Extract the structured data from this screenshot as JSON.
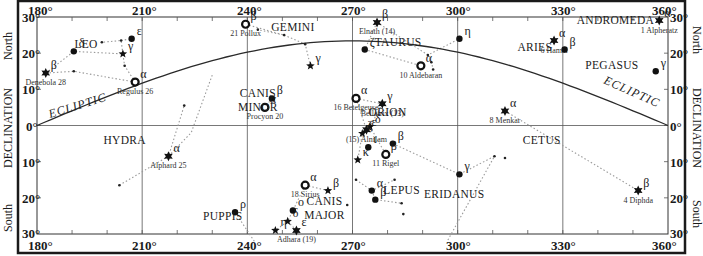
{
  "colors": {
    "frame": "#1a1a1a",
    "grid": "#555555",
    "ecliptic": "#2a2a2a",
    "constellation_line": "#9a9a9a",
    "star": "#111111",
    "text": "#1a1a1a"
  },
  "plot": {
    "left": 37,
    "right": 668,
    "top": 17,
    "bottom": 234,
    "ra_min": 180,
    "ra_max": 360,
    "dec_min": -30,
    "dec_max": 30
  },
  "axes": {
    "x_ticks_top": [
      "180°",
      "210°",
      "240°",
      "270°",
      "300°",
      "330°",
      "360°"
    ],
    "x_ticks_bottom": [
      "180°",
      "210°",
      "240°",
      "270°",
      "300°",
      "330°",
      "360°"
    ],
    "y_ticks": [
      "30°",
      "20°",
      "10°",
      "0°",
      "10°",
      "20°",
      "30°"
    ],
    "left_labels": {
      "north": "North",
      "center": "DECLINATION",
      "south": "South"
    },
    "right_labels": {
      "north": "North",
      "center": "DECLINATION",
      "south": "South"
    }
  },
  "ecliptic": {
    "label_left": "ECLIPTIC",
    "label_right": "ECLIPTIC"
  },
  "chart_data": {
    "type": "scatter",
    "xlabel": "Right Ascension (degrees)",
    "ylabel": "DECLINATION",
    "xlim": [
      180,
      360
    ],
    "ylim": [
      -30,
      30
    ],
    "x_ticks": [
      180,
      210,
      240,
      270,
      300,
      330,
      360
    ],
    "y_ticks": [
      30,
      20,
      10,
      0,
      -10,
      -20,
      -30
    ],
    "grid": true,
    "ecliptic_curve": [
      [
        180,
        0
      ],
      [
        195,
        6
      ],
      [
        210,
        11.5
      ],
      [
        225,
        16.5
      ],
      [
        240,
        20.3
      ],
      [
        255,
        22.6
      ],
      [
        270,
        23.4
      ],
      [
        285,
        22.6
      ],
      [
        300,
        20.3
      ],
      [
        315,
        16.5
      ],
      [
        330,
        11.5
      ],
      [
        345,
        6
      ],
      [
        360,
        0
      ]
    ],
    "constellations": [
      {
        "name": "LEO",
        "label_pos": [
          194,
          21.5
        ]
      },
      {
        "name": "GEMINI",
        "label_pos": [
          253,
          26
        ]
      },
      {
        "name": "TAURUS",
        "label_pos": [
          283,
          22
        ]
      },
      {
        "name": "ARIES",
        "label_pos": [
          322,
          20.5
        ]
      },
      {
        "name": "ANDROMEDA",
        "label_pos": [
          345,
          28
        ]
      },
      {
        "name": "PEGASUS",
        "label_pos": [
          344,
          15.5
        ]
      },
      {
        "name": "CANIS MINOR",
        "label_pos": [
          243,
          8
        ]
      },
      {
        "name": "ORION",
        "label_pos": [
          280,
          2.5
        ]
      },
      {
        "name": "HYDRA",
        "label_pos": [
          205,
          -5
        ]
      },
      {
        "name": "CETUS",
        "label_pos": [
          324,
          -5
        ]
      },
      {
        "name": "LEPUS",
        "label_pos": [
          284,
          -19
        ]
      },
      {
        "name": "ERIDANUS",
        "label_pos": [
          299,
          -20
        ]
      },
      {
        "name": "CANIS MAJOR",
        "label_pos": [
          262,
          -22
        ]
      },
      {
        "name": "PUPPIS",
        "label_pos": [
          233,
          -26
        ]
      }
    ],
    "stars": [
      {
        "id": "denebola",
        "greek": "β",
        "name": "Denebola 28",
        "ra": 182.5,
        "dec": 14.5,
        "sym": "star6"
      },
      {
        "id": "leo-delta",
        "greek": "δ",
        "ra": 190.5,
        "dec": 20.5,
        "sym": "dot"
      },
      {
        "id": "leo-gamma",
        "greek": "γ",
        "ra": 204.5,
        "dec": 19.8,
        "sym": "star5"
      },
      {
        "id": "leo-eps",
        "greek": "ε",
        "ra": 207,
        "dec": 24,
        "sym": "dot"
      },
      {
        "id": "regulus",
        "greek": "α",
        "name": "Regulus 26",
        "ra": 208,
        "dec": 12,
        "sym": "ring"
      },
      {
        "id": "pollux",
        "greek": "β",
        "name": "21 Pollux",
        "ra": 239.5,
        "dec": 28,
        "sym": "ring"
      },
      {
        "id": "gem-gamma",
        "greek": "γ",
        "ra": 258,
        "dec": 16.5,
        "sym": "star5"
      },
      {
        "id": "elnath",
        "greek": "β",
        "name": "Elnath (14)",
        "ra": 277,
        "dec": 28.5,
        "sym": "star6"
      },
      {
        "id": "tau-zeta",
        "greek": "ζ",
        "ra": 273.5,
        "dec": 21,
        "sym": "dot"
      },
      {
        "id": "aldebaran",
        "greek": "α",
        "name": "10 Aldebaran",
        "ra": 289.5,
        "dec": 16.5,
        "sym": "ring"
      },
      {
        "id": "tau-eta",
        "greek": "η",
        "ra": 300.5,
        "dec": 24,
        "sym": "dot"
      },
      {
        "id": "hamal",
        "greek": "α",
        "name": "6 Hamal",
        "ra": 327.5,
        "dec": 23.5,
        "sym": "star6"
      },
      {
        "id": "ari-beta",
        "greek": "β",
        "ra": 330.5,
        "dec": 21,
        "sym": "dot"
      },
      {
        "id": "alpheratz",
        "greek": "α",
        "name": "1 Alpheratz",
        "ra": 357.5,
        "dec": 29,
        "sym": "star6"
      },
      {
        "id": "peg-gamma",
        "greek": "γ",
        "ra": 356.5,
        "dec": 15,
        "sym": "dot"
      },
      {
        "id": "cmi-beta",
        "greek": "β",
        "ra": 247,
        "dec": 7.5,
        "sym": "dot"
      },
      {
        "id": "procyon",
        "greek": "α",
        "name": "Procyon 20",
        "ra": 245,
        "dec": 5,
        "sym": "ring"
      },
      {
        "id": "betelgeuse",
        "greek": "α",
        "name": "16 Betelgeuse",
        "ra": 271,
        "dec": 7.5,
        "sym": "ring"
      },
      {
        "id": "bellatrix",
        "greek": "γ",
        "name": "Bellatrix (13)",
        "ra": 278.5,
        "dec": 6,
        "sym": "star6"
      },
      {
        "id": "alnilam",
        "greek": "ε",
        "name": "(15) Alnilam",
        "ra": 274,
        "dec": -1.2,
        "sym": "star6"
      },
      {
        "id": "ori-delta",
        "greek": "δ",
        "ra": 275,
        "dec": -0.3,
        "sym": "star5"
      },
      {
        "id": "ori-zeta",
        "greek": "ζ",
        "ra": 272.8,
        "dec": -2.2,
        "sym": "star5"
      },
      {
        "id": "ori-iota",
        "greek": "ι",
        "ra": 274.5,
        "dec": -6,
        "sym": "dot"
      },
      {
        "id": "ori-beta-top",
        "greek": "β",
        "ra": 281.5,
        "dec": -5,
        "sym": "dot"
      },
      {
        "id": "rigel",
        "greek": "β",
        "name": "11 Rigel",
        "ra": 279.5,
        "dec": -8,
        "sym": "ring"
      },
      {
        "id": "ori-kappa",
        "greek": "κ",
        "ra": 271.5,
        "dec": -9.5,
        "sym": "star5"
      },
      {
        "id": "menkar",
        "greek": "α",
        "name": "8 Menkar",
        "ra": 313.5,
        "dec": 4,
        "sym": "star6"
      },
      {
        "id": "eri-gamma",
        "greek": "γ",
        "ra": 300.5,
        "dec": -13.5,
        "sym": "dot"
      },
      {
        "id": "diphda",
        "greek": "β",
        "name": "4 Diphda",
        "ra": 351.5,
        "dec": -18,
        "sym": "star6"
      },
      {
        "id": "alphard",
        "greek": "α",
        "name": "Alphard 25",
        "ra": 217.5,
        "dec": -8.5,
        "sym": "star6"
      },
      {
        "id": "sirius",
        "greek": "α",
        "name": "18 Sirius",
        "ra": 256.5,
        "dec": -16.5,
        "sym": "ring"
      },
      {
        "id": "cma-beta",
        "greek": "β",
        "ra": 263,
        "dec": -18,
        "sym": "star5"
      },
      {
        "id": "cma-omicron",
        "greek": "ο",
        "ra": 253,
        "dec": -23.5,
        "sym": "dot"
      },
      {
        "id": "cma-delta",
        "greek": "δ",
        "ra": 251.5,
        "dec": -26.5,
        "sym": "star5"
      },
      {
        "id": "adhara",
        "greek": "ε",
        "name": "Adhara (19)",
        "ra": 254,
        "dec": -29,
        "sym": "star6"
      },
      {
        "id": "cma-eta",
        "greek": "η",
        "ra": 248,
        "dec": -29,
        "sym": "star5"
      },
      {
        "id": "lep-alpha",
        "greek": "α",
        "ra": 275.5,
        "dec": -18,
        "sym": "dot"
      },
      {
        "id": "lep-beta",
        "greek": "β",
        "ra": 276.5,
        "dec": -20.5,
        "sym": "dot"
      },
      {
        "id": "pup-rho",
        "greek": "ρ",
        "ra": 236.5,
        "dec": -24,
        "sym": "dot"
      }
    ],
    "faint_points": [
      [
        198.5,
        23
      ],
      [
        204,
        23.5
      ],
      [
        205,
        16.5
      ],
      [
        190.5,
        15
      ],
      [
        250.5,
        25
      ],
      [
        256.5,
        22.5
      ],
      [
        243,
        26.5
      ],
      [
        291.5,
        19.5
      ],
      [
        292.5,
        17.5
      ],
      [
        293,
        15.5
      ],
      [
        222,
        5.5
      ],
      [
        203.5,
        -16.5
      ],
      [
        271,
        -15
      ],
      [
        282,
        -15
      ],
      [
        284,
        -21.5
      ],
      [
        310.5,
        -8.5
      ],
      [
        268.5,
        -22
      ],
      [
        284.5,
        -24.5
      ],
      [
        313.5,
        -9
      ]
    ],
    "lines": [
      [
        [
          182.5,
          14.5
        ],
        [
          190.5,
          20.5
        ],
        [
          204.5,
          19.8
        ],
        [
          205,
          16.5
        ],
        [
          208,
          12
        ]
      ],
      [
        [
          182.5,
          14.5
        ],
        [
          190.5,
          15
        ],
        [
          208,
          12
        ]
      ],
      [
        [
          204.5,
          19.8
        ],
        [
          204,
          23.5
        ],
        [
          198.5,
          23
        ]
      ],
      [
        [
          204,
          23.5
        ],
        [
          207,
          24
        ]
      ],
      [
        [
          239.5,
          28
        ],
        [
          250.5,
          25
        ],
        [
          243,
          26.5
        ]
      ],
      [
        [
          250.5,
          25
        ],
        [
          256.5,
          22.5
        ],
        [
          258,
          16.5
        ]
      ],
      [
        [
          277,
          28.5
        ],
        [
          273.5,
          21
        ],
        [
          289.5,
          16.5
        ]
      ],
      [
        [
          277,
          28.5
        ],
        [
          291.5,
          19.5
        ],
        [
          300.5,
          24
        ]
      ],
      [
        [
          291.5,
          19.5
        ],
        [
          292.5,
          17.5
        ],
        [
          293,
          15.5
        ]
      ],
      [
        [
          247,
          7.5
        ],
        [
          245,
          5
        ]
      ],
      [
        [
          271,
          7.5
        ],
        [
          274,
          -1.2
        ],
        [
          272.8,
          -2.2
        ],
        [
          271.5,
          -9.5
        ]
      ],
      [
        [
          278.5,
          6
        ],
        [
          275,
          -0.3
        ]
      ],
      [
        [
          271,
          7.5
        ],
        [
          278.5,
          6
        ]
      ],
      [
        [
          275,
          -0.3
        ],
        [
          279.5,
          -8
        ]
      ],
      [
        [
          281.5,
          -5
        ],
        [
          300.5,
          -13.5
        ],
        [
          310.5,
          -8.5
        ],
        [
          297,
          -32
        ]
      ],
      [
        [
          313.5,
          4
        ],
        [
          351.5,
          -18
        ]
      ],
      [
        [
          203.5,
          -16.5
        ],
        [
          217.5,
          -8.5
        ],
        [
          222,
          5.5
        ]
      ],
      [
        [
          217.5,
          -8.5
        ],
        [
          224,
          -2
        ],
        [
          230,
          14
        ]
      ],
      [
        [
          256.5,
          -16.5
        ],
        [
          263,
          -18
        ]
      ],
      [
        [
          256.5,
          -16.5
        ],
        [
          253,
          -23.5
        ],
        [
          251.5,
          -26.5
        ],
        [
          248,
          -29
        ]
      ],
      [
        [
          251.5,
          -26.5
        ],
        [
          254,
          -29
        ]
      ],
      [
        [
          271,
          -15
        ],
        [
          275.5,
          -18
        ],
        [
          282,
          -15
        ]
      ],
      [
        [
          275.5,
          -18
        ],
        [
          276.5,
          -20.5
        ],
        [
          284,
          -21.5
        ]
      ],
      [
        [
          236.5,
          -24
        ],
        [
          242,
          -32
        ]
      ]
    ]
  }
}
